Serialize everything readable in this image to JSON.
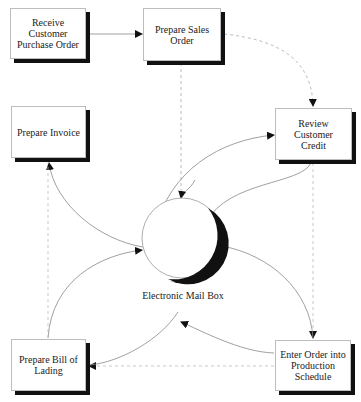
{
  "diagram": {
    "type": "process-flow",
    "nodes": [
      {
        "id": "receive_po",
        "label": "Receive Customer Purchase Order",
        "line1": "Receive Customer",
        "line2": "Purchase Order"
      },
      {
        "id": "prepare_sales_order",
        "label": "Prepare Sales Order",
        "line1": "Prepare Sales Order",
        "line2": ""
      },
      {
        "id": "prepare_invoice",
        "label": "Prepare Invoice",
        "line1": "Prepare Invoice",
        "line2": ""
      },
      {
        "id": "review_credit",
        "label": "Review Customer Credit",
        "line1": "Review Customer",
        "line2": "Credit"
      },
      {
        "id": "bill_of_lading",
        "label": "Prepare Bill of Lading",
        "line1": "Prepare Bill of",
        "line2": "Lading"
      },
      {
        "id": "enter_order",
        "label": "Enter Order into Production Schedule",
        "line1": "Enter Order into",
        "line2": "Production Schedule"
      }
    ],
    "hub": {
      "id": "email_box",
      "label": "Electronic Mail Box",
      "shape": "circle"
    },
    "edges": [
      {
        "from": "receive_po",
        "to": "prepare_sales_order",
        "style": "solid"
      },
      {
        "from": "prepare_sales_order",
        "to": "review_credit",
        "style": "dashed"
      },
      {
        "from": "prepare_sales_order",
        "to": "email_box",
        "style": "solid"
      },
      {
        "from": "email_box",
        "to": "review_credit",
        "style": "solid"
      },
      {
        "from": "review_credit",
        "to": "email_box",
        "style": "solid"
      },
      {
        "from": "review_credit",
        "to": "enter_order",
        "style": "dashed"
      },
      {
        "from": "email_box",
        "to": "enter_order",
        "style": "solid"
      },
      {
        "from": "enter_order",
        "to": "bill_of_lading",
        "style": "dashed"
      },
      {
        "from": "enter_order",
        "to": "bill_of_lading",
        "style": "solid",
        "via": "curve"
      },
      {
        "from": "bill_of_lading",
        "to": "email_box",
        "style": "solid"
      },
      {
        "from": "email_box",
        "to": "prepare_invoice",
        "style": "solid"
      },
      {
        "from": "bill_of_lading",
        "to": "prepare_invoice",
        "style": "dashed"
      }
    ],
    "colors": {
      "line": "#8a8a8a",
      "arrow": "#111111",
      "shadow": "#111111",
      "border": "#bdbdbd"
    }
  }
}
